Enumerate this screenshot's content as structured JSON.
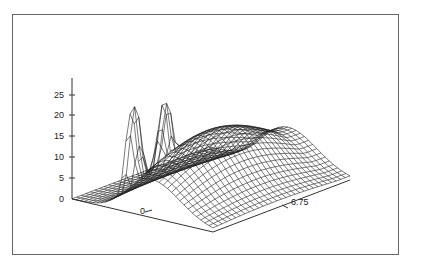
{
  "chart_data": {
    "type": "surface3d",
    "title": "",
    "xlabel": "",
    "ylabel": "",
    "zlabel": "",
    "z_ticks": [
      0,
      5,
      10,
      15,
      20,
      25
    ],
    "x_ticks": [
      "0"
    ],
    "y_ticks": [
      "6.75"
    ],
    "zlim": [
      0,
      28
    ],
    "peaks": [
      {
        "z": 26.5
      },
      {
        "z": 25
      }
    ],
    "grid": false,
    "legend": null
  },
  "axis": {
    "z_tick_labels": [
      "25",
      "20",
      "15",
      "10",
      "5",
      "0"
    ],
    "x_tick_label": "0",
    "y_tick_label": "6.75"
  }
}
